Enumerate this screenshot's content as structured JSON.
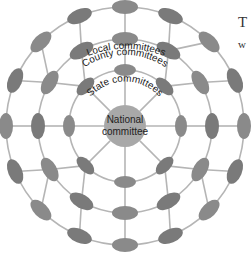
{
  "diagram": {
    "center": {
      "x": 125,
      "y": 126
    },
    "colors": {
      "node": "#8a8a8a",
      "node_dark": "#7a7a7a",
      "line": "#b5b5b5",
      "national": "#a8a8a8",
      "text": "#222222"
    },
    "national": {
      "label_line1": "National",
      "label_line2": "committee",
      "radius": 21
    },
    "rings": [
      {
        "name": "State committees",
        "radius": 56,
        "count": 8,
        "offset_deg": -90,
        "rx": 11,
        "ry": 6
      },
      {
        "name": "County committees",
        "radius": 87,
        "count": 12,
        "offset_deg": -90,
        "rx": 13,
        "ry": 7
      },
      {
        "name": "Local committees",
        "radius": 119,
        "count": 16,
        "offset_deg": -90,
        "rx": 13,
        "ry": 7
      }
    ],
    "labels": {
      "state": "State committees",
      "county": "County committees",
      "local": "Local committees"
    }
  },
  "side_text": {
    "line1": "T",
    "line2": "w"
  }
}
